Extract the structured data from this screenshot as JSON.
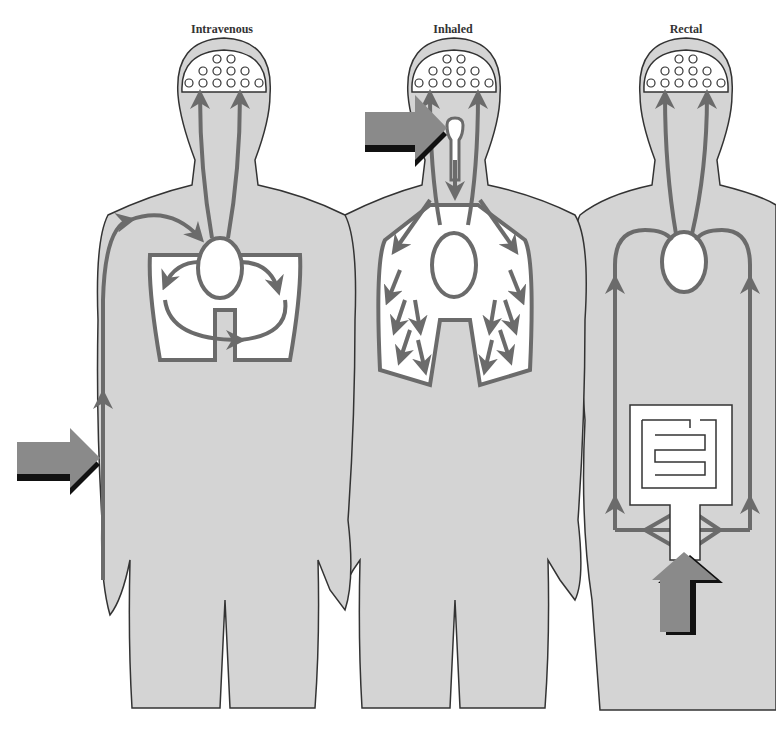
{
  "diagram": {
    "type": "drug-administration-routes",
    "colors": {
      "body_fill": "#d4d4d4",
      "outline": "#333333",
      "vessel": "#6b6b6b",
      "organ_fill": "#ffffff",
      "entry_arrow_fill": "#8a8a8a",
      "entry_arrow_shadow": "#111111"
    },
    "figures": [
      {
        "id": "intravenous",
        "title": "Intravenous",
        "entry_point": "arm",
        "entry_arrow_direction": "right"
      },
      {
        "id": "inhaled",
        "title": "Inhaled",
        "entry_point": "mouth/airway",
        "entry_arrow_direction": "right"
      },
      {
        "id": "rectal",
        "title": "Rectal",
        "entry_point": "rectum",
        "entry_arrow_direction": "up"
      }
    ]
  }
}
